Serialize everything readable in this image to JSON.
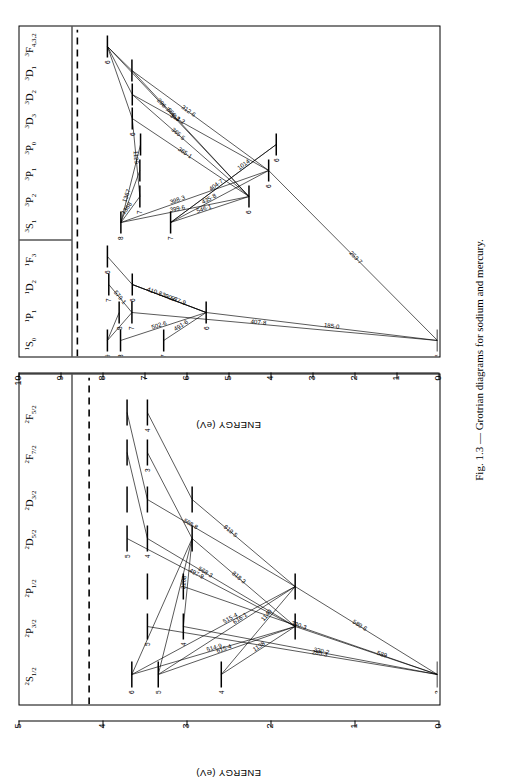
{
  "figure": {
    "caption": "Fig. 1.3 — Grotrian diagrams for sodium and mercury.",
    "axis_title": "ENERGY (eV)"
  },
  "sodium": {
    "element": "sodium",
    "terms": [
      "2S1/2",
      "2P3/2",
      "2P1/2",
      "2D5/2",
      "2D3/2",
      "2F7/2",
      "2F5/2"
    ],
    "term_parts": [
      {
        "mult": "2",
        "letter": "S",
        "j": "1/2"
      },
      {
        "mult": "2",
        "letter": "P",
        "j": "3/2"
      },
      {
        "mult": "2",
        "letter": "P",
        "j": "1/2"
      },
      {
        "mult": "2",
        "letter": "D",
        "j": "5/2"
      },
      {
        "mult": "2",
        "letter": "D",
        "j": "3/2"
      },
      {
        "mult": "2",
        "letter": "F",
        "j": "7/2"
      },
      {
        "mult": "2",
        "letter": "F",
        "j": "5/2"
      }
    ],
    "axis": {
      "label": "ENERGY (eV)",
      "ticks": [
        "5",
        "4",
        "3",
        "2",
        "1",
        "0"
      ],
      "min": 0,
      "max": 5.4
    },
    "ionisation_limit": 5.14,
    "level_numbers": [
      "3",
      "4",
      "5",
      "6",
      "7"
    ],
    "wavelengths": [
      "285·3",
      "330·2",
      "330·3",
      "497·9",
      "514·9",
      "515·4",
      "568·3",
      "568·8",
      "589",
      "589·6",
      "615·4",
      "616·1",
      "818·3",
      "819·5",
      "1138",
      "1140",
      "2208"
    ]
  },
  "mercury": {
    "element": "mercury",
    "terms": [
      "1S0",
      "1P1",
      "1D2",
      "1F3",
      "3S1",
      "3P2",
      "3P1",
      "3P0",
      "3D3",
      "3D2",
      "3D1",
      "3F4,3,2"
    ],
    "term_parts": [
      {
        "mult": "1",
        "letter": "S",
        "j": "0"
      },
      {
        "mult": "1",
        "letter": "P",
        "j": "1"
      },
      {
        "mult": "1",
        "letter": "D",
        "j": "2"
      },
      {
        "mult": "1",
        "letter": "F",
        "j": "3"
      },
      {
        "mult": "3",
        "letter": "S",
        "j": "1"
      },
      {
        "mult": "3",
        "letter": "P",
        "j": "2"
      },
      {
        "mult": "3",
        "letter": "P",
        "j": "1"
      },
      {
        "mult": "3",
        "letter": "P",
        "j": "0"
      },
      {
        "mult": "3",
        "letter": "D",
        "j": "3"
      },
      {
        "mult": "3",
        "letter": "D",
        "j": "2"
      },
      {
        "mult": "3",
        "letter": "D",
        "j": "1"
      },
      {
        "mult": "3",
        "letter": "F",
        "j": "4,3,2"
      }
    ],
    "axis": {
      "label": "ENERGY (eV)",
      "ticks": [
        "10",
        "9",
        "8",
        "7",
        "6",
        "5",
        "4",
        "3",
        "2",
        "1",
        "0"
      ],
      "min": 0,
      "max": 10.6
    },
    "ionisation_limit": 10.43,
    "level_numbers": [
      "6",
      "7",
      "8",
      "9"
    ],
    "wavelengths": [
      "185·0",
      "253·7",
      "296·7",
      "312·6",
      "313·2",
      "365·1",
      "365·5",
      "366·3",
      "390·6",
      "398·3",
      "399·6",
      "404·7",
      "407·8",
      "410·8",
      "435·8",
      "491·6",
      "502·6",
      "546·1",
      "577·9",
      "579·1",
      "1014",
      "1129",
      "1367",
      "1368"
    ]
  },
  "chart_data": {
    "type": "scatter",
    "title": "Grotrian diagrams for sodium and mercury",
    "panels": [
      {
        "name": "sodium",
        "xlabel": "term symbol",
        "ylabel": "ENERGY (eV)",
        "ylim": [
          0,
          5.4
        ],
        "yticks": [
          0,
          1,
          2,
          3,
          4,
          5
        ],
        "columns": [
          "2S1/2",
          "2P3/2",
          "2P1/2",
          "2D5/2",
          "2D3/2",
          "2F7/2",
          "2F5/2"
        ],
        "levels": [
          {
            "term": "2S1/2",
            "n": "3",
            "energy": 0.0
          },
          {
            "term": "2S1/2",
            "n": "4",
            "energy": 3.19
          },
          {
            "term": "2S1/2",
            "n": "5",
            "energy": 4.12
          },
          {
            "term": "2S1/2",
            "n": "6",
            "energy": 4.51
          },
          {
            "term": "2P3/2",
            "n": "3",
            "energy": 2.1
          },
          {
            "term": "2P3/2",
            "n": "4",
            "energy": 3.75
          },
          {
            "term": "2P3/2",
            "n": "5",
            "energy": 4.28
          },
          {
            "term": "2P1/2",
            "n": "3",
            "energy": 2.1
          },
          {
            "term": "2P1/2",
            "n": "4",
            "energy": 3.75
          },
          {
            "term": "2P1/2",
            "n": "5",
            "energy": 4.28
          },
          {
            "term": "2D5/2",
            "n": "3",
            "energy": 3.62
          },
          {
            "term": "2D5/2",
            "n": "4",
            "energy": 4.28
          },
          {
            "term": "2D5/2",
            "n": "5",
            "energy": 4.58
          },
          {
            "term": "2D3/2",
            "n": "3",
            "energy": 3.62
          },
          {
            "term": "2D3/2",
            "n": "4",
            "energy": 4.28
          },
          {
            "term": "2D3/2",
            "n": "5",
            "energy": 4.58
          },
          {
            "term": "2F7/2",
            "n": "4",
            "energy": 4.28
          },
          {
            "term": "2F7/2",
            "n": "5",
            "energy": 4.58
          },
          {
            "term": "2F5/2",
            "n": "4",
            "energy": 4.28
          },
          {
            "term": "2F5/2",
            "n": "5",
            "energy": 4.58
          }
        ],
        "transitions": [
          {
            "label": "285·3",
            "from": "2P3/2 n=5",
            "to": "2S1/2 n=3"
          },
          {
            "label": "330·2",
            "from": "2P3/2 n=4",
            "to": "2S1/2 n=3"
          },
          {
            "label": "330·3",
            "from": "2P1/2 n=4",
            "to": "2S1/2 n=3"
          },
          {
            "label": "589",
            "from": "2P3/2 n=3",
            "to": "2S1/2 n=3"
          },
          {
            "label": "589·6",
            "from": "2P1/2 n=3",
            "to": "2S1/2 n=3"
          },
          {
            "label": "497·9",
            "from": "2D n=5",
            "to": "2P n=3"
          },
          {
            "label": "568·3",
            "from": "2D n=4",
            "to": "2P n=3"
          },
          {
            "label": "568·8",
            "from": "2D n=4",
            "to": "2P n=3"
          },
          {
            "label": "818·3",
            "from": "2D n=3",
            "to": "2P n=3"
          },
          {
            "label": "819·5",
            "from": "2D n=3",
            "to": "2P n=3"
          },
          {
            "label": "514·9",
            "from": "2S1/2 n=6",
            "to": "2P n=3"
          },
          {
            "label": "515·4",
            "from": "2S1/2 n=6",
            "to": "2P n=3"
          },
          {
            "label": "615·4",
            "from": "2S1/2 n=5",
            "to": "2P n=3"
          },
          {
            "label": "616·1",
            "from": "2S1/2 n=5",
            "to": "2P n=3"
          },
          {
            "label": "1138",
            "from": "2S1/2 n=4",
            "to": "2P n=3"
          },
          {
            "label": "1140",
            "from": "2S1/2 n=4",
            "to": "2P n=3"
          },
          {
            "label": "2208",
            "from": "2P n=4",
            "to": "2D n=3"
          },
          {
            "label": "330·3",
            "from": "2P1/2 n=4",
            "to": "2S1/2 n=3"
          }
        ]
      },
      {
        "name": "mercury",
        "xlabel": "term symbol",
        "ylabel": "ENERGY (eV)",
        "ylim": [
          0,
          10.6
        ],
        "yticks": [
          0,
          1,
          2,
          3,
          4,
          5,
          6,
          7,
          8,
          9,
          10
        ],
        "columns": [
          "1S0",
          "1P1",
          "1D2",
          "1F3",
          "3S1",
          "3P2",
          "3P1",
          "3P0",
          "3D3",
          "3D2",
          "3D1",
          "3F4,3,2"
        ],
        "levels": [
          {
            "term": "1S0",
            "n": "6",
            "energy": 0.0
          },
          {
            "term": "1S0",
            "n": "7",
            "energy": 7.93
          },
          {
            "term": "1S0",
            "n": "8",
            "energy": 9.18
          },
          {
            "term": "1S0",
            "n": "9",
            "energy": 9.56
          },
          {
            "term": "1P1",
            "n": "6",
            "energy": 6.7
          },
          {
            "term": "1P1",
            "n": "7",
            "energy": 8.85
          },
          {
            "term": "1P1",
            "n": "8",
            "energy": 9.22
          },
          {
            "term": "1D2",
            "n": "6",
            "energy": 8.84
          },
          {
            "term": "1D2",
            "n": "7",
            "energy": 9.52
          },
          {
            "term": "1F3",
            "n": "6",
            "energy": 9.56
          },
          {
            "term": "3S1",
            "n": "7",
            "energy": 7.73
          },
          {
            "term": "3S1",
            "n": "8",
            "energy": 9.17
          },
          {
            "term": "3P2",
            "n": "6",
            "energy": 5.46
          },
          {
            "term": "3P2",
            "n": "7",
            "energy": 8.62
          },
          {
            "term": "3P1",
            "n": "6",
            "energy": 4.89
          },
          {
            "term": "3P1",
            "n": "7",
            "energy": 8.62
          },
          {
            "term": "3P0",
            "n": "6",
            "energy": 4.67
          },
          {
            "term": "3P0",
            "n": "7",
            "energy": 8.6
          },
          {
            "term": "3D3",
            "n": "6",
            "energy": 8.84
          },
          {
            "term": "3D2",
            "n": "6",
            "energy": 8.84
          },
          {
            "term": "3D1",
            "n": "6",
            "energy": 8.85
          },
          {
            "term": "3F4,3,2",
            "n": "6",
            "energy": 9.56
          }
        ],
        "transitions": [
          {
            "label": "185·0",
            "from": "1P1 n=6",
            "to": "1S0 n=6"
          },
          {
            "label": "253·7",
            "from": "3P1 n=6",
            "to": "1S0 n=6"
          },
          {
            "label": "296·7",
            "from": "3D n=6",
            "to": "3P2 n=6"
          },
          {
            "label": "312·6",
            "from": "3D n=6",
            "to": "3P1 n=6"
          },
          {
            "label": "313·2",
            "from": "3D n=6",
            "to": "3P1 n=6"
          },
          {
            "label": "365·1",
            "from": "3D3 n=6",
            "to": "3P2 n=6"
          },
          {
            "label": "365·5",
            "from": "3D2 n=6",
            "to": "3P2 n=6"
          },
          {
            "label": "366·3",
            "from": "3D1 n=6",
            "to": "3P2 n=6"
          },
          {
            "label": "390·6",
            "from": "1D2 n=6",
            "to": "1P1 n=6"
          },
          {
            "label": "398·3",
            "from": "3S1 n=8",
            "to": "3P n=6"
          },
          {
            "label": "399·6",
            "from": "3S1 n=8",
            "to": "3P n=6"
          },
          {
            "label": "404·7",
            "from": "3S1 n=7",
            "to": "3P0 n=6"
          },
          {
            "label": "407·8",
            "from": "1P1 n=7",
            "to": "1S0 n=6"
          },
          {
            "label": "410·8",
            "from": "1D2 n=6",
            "to": "1P1 n=6"
          },
          {
            "label": "435·8",
            "from": "3S1 n=7",
            "to": "3P1 n=6"
          },
          {
            "label": "491·6",
            "from": "1S0 n=7",
            "to": "1P1 n=6"
          },
          {
            "label": "502·6",
            "from": "1S0 n=8",
            "to": "1P1 n=6"
          },
          {
            "label": "546·1",
            "from": "3S1 n=7",
            "to": "3P2 n=6"
          },
          {
            "label": "577·9",
            "from": "1D2 n=6",
            "to": "1P1 n=6"
          },
          {
            "label": "579·1",
            "from": "1D2 n=6",
            "to": "1P1 n=6"
          },
          {
            "label": "1014",
            "from": "3S1 n=7",
            "to": "3P n=6"
          },
          {
            "label": "1129",
            "from": "3D n=6",
            "to": "3P n=6"
          },
          {
            "label": "1367",
            "from": "3S1 n=7",
            "to": "3P n=6"
          },
          {
            "label": "1368",
            "from": "3S1 n=7",
            "to": "3P n=6"
          }
        ]
      }
    ]
  }
}
